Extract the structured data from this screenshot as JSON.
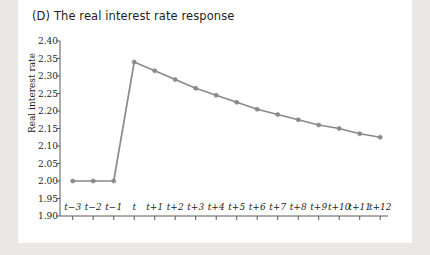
{
  "figure": {
    "panel_label": "(D)",
    "title": "(D) The real interest rate response",
    "background": "#e9e8e6",
    "panel_background": "#ffffff",
    "series_color": "#8a8a8a",
    "axis_color": "#58595b",
    "text_color": "#231f20"
  },
  "chart_data": {
    "type": "line",
    "title": "(D) The real interest rate response",
    "xlabel": "",
    "ylabel": "Real interest rate",
    "ylim": [
      1.9,
      2.4
    ],
    "ytick_step": 0.05,
    "ytick_labels": [
      "2.40",
      "2.35",
      "2.30",
      "2.25",
      "2.20",
      "2.15",
      "2.10",
      "2.05",
      "2.00",
      "1.95",
      "1.90"
    ],
    "ytick_values": [
      2.4,
      2.35,
      2.3,
      2.25,
      2.2,
      2.15,
      2.1,
      2.05,
      2.0,
      1.95,
      1.9
    ],
    "categories": [
      "t−3",
      "t−2",
      "t−1",
      "t",
      "t+1",
      "t+2",
      "t+3",
      "t+4",
      "t+5",
      "t+6",
      "t+7",
      "t+8",
      "t+9",
      "t+10",
      "t+11",
      "t+12"
    ],
    "values": [
      2.0,
      2.0,
      2.0,
      2.34,
      2.315,
      2.29,
      2.265,
      2.245,
      2.225,
      2.205,
      2.19,
      2.175,
      2.16,
      2.15,
      2.135,
      2.125
    ],
    "grid": false,
    "legend": "none",
    "markers": "circle",
    "series": [
      {
        "name": "Real interest rate",
        "values": [
          2.0,
          2.0,
          2.0,
          2.34,
          2.315,
          2.29,
          2.265,
          2.245,
          2.225,
          2.205,
          2.19,
          2.175,
          2.16,
          2.15,
          2.135,
          2.125
        ]
      }
    ]
  }
}
